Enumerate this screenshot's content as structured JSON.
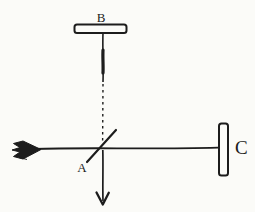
{
  "figure": {
    "kind": "interferometer-schematic",
    "labels": {
      "beam_splitter": "A",
      "mirror_top": "B",
      "mirror_right": "C"
    },
    "colors": {
      "ink": "#1c1c1c",
      "paper": "#fbfbf8"
    }
  }
}
